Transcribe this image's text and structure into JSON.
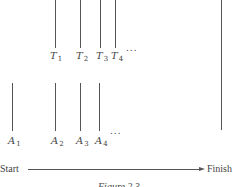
{
  "diagram": {
    "top_markers": [
      {
        "base": "T",
        "sub": "1",
        "x": 55
      },
      {
        "base": "T",
        "sub": "2",
        "x": 80
      },
      {
        "base": "T",
        "sub": "3",
        "x": 100
      },
      {
        "base": "T",
        "sub": "4",
        "x": 115
      }
    ],
    "top_ellipsis": "...",
    "bottom_markers": [
      {
        "base": "A",
        "sub": "1",
        "x": 12
      },
      {
        "base": "A",
        "sub": "2",
        "x": 55
      },
      {
        "base": "A",
        "sub": "3",
        "x": 80
      },
      {
        "base": "A",
        "sub": "4",
        "x": 99
      }
    ],
    "bottom_ellipsis": "...",
    "axis": {
      "start_label": "Start",
      "finish_label": "Finish"
    },
    "caption": "Figure 2.3"
  }
}
